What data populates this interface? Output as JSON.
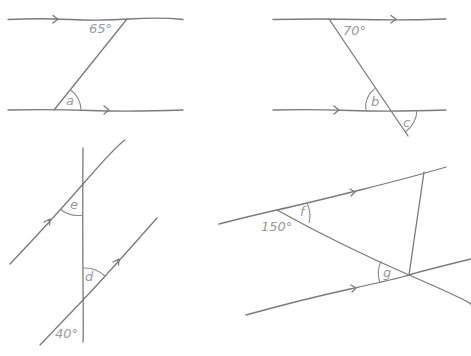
{
  "diagram": {
    "type": "parallel-lines-angle-problems",
    "panels": [
      {
        "id": "top-left",
        "given_angle": "65°",
        "unknown": "a"
      },
      {
        "id": "top-right",
        "given_angle": "70°",
        "unknowns": [
          "b",
          "c"
        ]
      },
      {
        "id": "bottom-left",
        "given_angle": "40°",
        "unknowns": [
          "e",
          "d"
        ]
      },
      {
        "id": "bottom-right",
        "given_angle": "150°",
        "unknowns": [
          "f",
          "g"
        ]
      }
    ]
  },
  "labels": {
    "tl_given": "65°",
    "tl_a": "a",
    "tr_given": "70°",
    "tr_b": "b",
    "tr_c": "c",
    "bl_e": "e",
    "bl_d": "d",
    "bl_given": "40°",
    "br_given": "150°",
    "br_f": "f",
    "br_g": "g"
  }
}
